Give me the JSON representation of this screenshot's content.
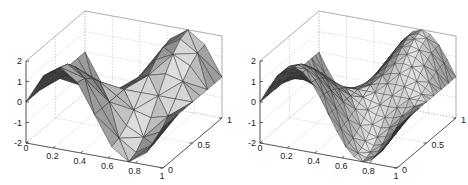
{
  "chart_data": [
    {
      "type": "surface",
      "title": "",
      "description": "Triangulated surface plot, coarse mesh (flat shaded)",
      "mesh": "coarse",
      "grid_n": 8,
      "function": "z = 2*sin(2*pi*x)*cos(pi*y) (approx. shape)",
      "xlim": [
        0,
        1
      ],
      "ylim": [
        0,
        1
      ],
      "zlim": [
        -2,
        2
      ],
      "xticks": [
        "0",
        "0.2",
        "0.4",
        "0.6",
        "0.8",
        "1"
      ],
      "yticks": [
        "0",
        "0.5",
        "1"
      ],
      "zticks": [
        "2",
        "1",
        "0",
        "-1",
        "-2"
      ],
      "grid": true,
      "origin_px": [
        26,
        143
      ],
      "edge_color": "#333333"
    },
    {
      "type": "surface",
      "title": "",
      "description": "Triangulated surface plot, refined mesh (flat shaded)",
      "mesh": "fine",
      "grid_n": 16,
      "function": "z = 2*sin(2*pi*x)*cos(pi*y) (approx. shape)",
      "xlim": [
        0,
        1
      ],
      "ylim": [
        0,
        1
      ],
      "zlim": [
        -2,
        2
      ],
      "xticks": [
        "0",
        "0.2",
        "0.4",
        "0.6",
        "0.8",
        "1"
      ],
      "yticks": [
        "0",
        "0.5",
        "1"
      ],
      "zticks": [
        "2",
        "1",
        "0",
        "-1",
        "-2"
      ],
      "grid": true,
      "origin_px": [
        260,
        143
      ],
      "edge_color": "#2a2a2a"
    }
  ]
}
